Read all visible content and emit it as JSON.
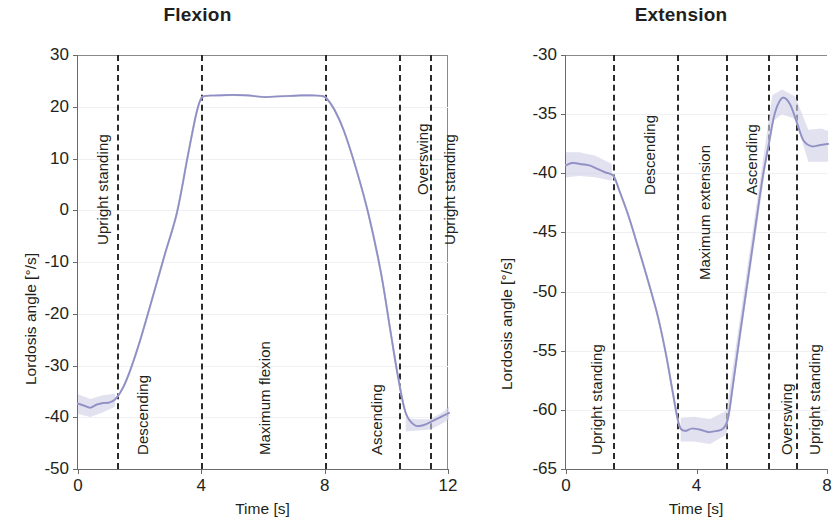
{
  "figure": {
    "panels": [
      {
        "key": "flexion",
        "title": "Flexion",
        "ylabel": "Lordosis angle [°/s]",
        "xlabel": "Time [s]",
        "yticks": [
          "30",
          "20",
          "10",
          "0",
          "-10",
          "-20",
          "-30",
          "-40",
          "-50"
        ],
        "xticks": [
          "0",
          "4",
          "8",
          "12"
        ],
        "phases": [
          "Upright standing",
          "Descending",
          "Maximum flexion",
          "Ascending",
          "Overswing",
          "Upright standing"
        ]
      },
      {
        "key": "extension",
        "title": "Extension",
        "ylabel": "Lordosis angle [°/s]",
        "xlabel": "Time [s]",
        "yticks": [
          "-30",
          "-35",
          "-40",
          "-45",
          "-50",
          "-55",
          "-60",
          "-65"
        ],
        "xticks": [
          "0",
          "4",
          "8"
        ],
        "phases": [
          "Upright standing",
          "Descending",
          "Maximum extension",
          "Ascending",
          "Overswing",
          "Upright standing"
        ]
      }
    ]
  },
  "chart_data": [
    {
      "type": "line",
      "title": "Flexion",
      "xlabel": "Time [s]",
      "ylabel": "Lordosis angle [°/s]",
      "xlim": [
        0,
        12
      ],
      "ylim": [
        -50,
        30
      ],
      "xticks": [
        0,
        4,
        8,
        12
      ],
      "yticks": [
        30,
        20,
        10,
        0,
        -10,
        -20,
        -30,
        -40,
        -50
      ],
      "grid": "horizontal-faint",
      "legend": "none",
      "phase_boundaries_s": [
        1.25,
        4.0,
        8.0,
        10.4,
        11.4
      ],
      "phase_labels": [
        {
          "label": "Upright standing",
          "start_s": 0.0,
          "end_s": 1.25
        },
        {
          "label": "Descending",
          "start_s": 1.25,
          "end_s": 4.0
        },
        {
          "label": "Maximum flexion",
          "start_s": 4.0,
          "end_s": 8.0
        },
        {
          "label": "Ascending",
          "start_s": 8.0,
          "end_s": 10.4
        },
        {
          "label": "Overswing",
          "start_s": 10.4,
          "end_s": 11.4
        },
        {
          "label": "Upright standing",
          "start_s": 11.4,
          "end_s": 12.0
        }
      ],
      "series": [
        {
          "name": "Mean lordosis angle",
          "x": [
            0.0,
            0.2,
            0.4,
            0.6,
            0.8,
            1.0,
            1.2,
            1.45,
            1.7,
            2.0,
            2.4,
            2.8,
            3.2,
            3.55,
            3.8,
            3.95,
            4.1,
            4.5,
            5.0,
            5.5,
            6.0,
            6.4,
            6.8,
            7.2,
            7.6,
            7.9,
            8.05,
            8.3,
            8.6,
            9.0,
            9.4,
            9.8,
            10.1,
            10.35,
            10.6,
            10.9,
            11.2,
            11.45,
            11.7,
            12.0
          ],
          "y": [
            -37.2,
            -37.6,
            -38.0,
            -37.4,
            -37.1,
            -37.0,
            -36.4,
            -34.2,
            -30.6,
            -25.2,
            -17.0,
            -8.6,
            -0.4,
            10.5,
            18.0,
            21.2,
            22.1,
            22.2,
            22.3,
            22.2,
            21.9,
            22.0,
            22.1,
            22.2,
            22.2,
            22.1,
            21.6,
            19.4,
            15.4,
            8.0,
            -0.8,
            -12.0,
            -23.0,
            -32.0,
            -39.0,
            -41.4,
            -41.3,
            -40.6,
            -39.9,
            -39.0
          ]
        },
        {
          "name": "Variability band (upper)",
          "x": [
            0.0,
            0.4,
            0.8,
            1.2,
            10.6,
            11.0,
            11.4,
            11.8,
            12.0
          ],
          "y": [
            -35.4,
            -36.3,
            -35.6,
            -35.3,
            -40.0,
            -40.2,
            -40.2,
            -38.8,
            -37.8
          ]
        },
        {
          "name": "Variability band (lower)",
          "x": [
            0.0,
            0.4,
            0.8,
            1.2,
            10.6,
            11.0,
            11.4,
            11.8,
            12.0
          ],
          "y": [
            -39.2,
            -39.8,
            -38.9,
            -37.8,
            -42.6,
            -42.4,
            -42.2,
            -41.0,
            -40.2
          ]
        }
      ]
    },
    {
      "type": "line",
      "title": "Extension",
      "xlabel": "Time [s]",
      "ylabel": "Lordosis angle [°/s]",
      "xlim": [
        0,
        8
      ],
      "ylim": [
        -65,
        -30
      ],
      "xticks": [
        0,
        4,
        8
      ],
      "yticks": [
        -30,
        -35,
        -40,
        -45,
        -50,
        -55,
        -60,
        -65
      ],
      "grid": "horizontal-faint",
      "legend": "none",
      "phase_boundaries_s": [
        1.45,
        3.4,
        4.9,
        6.2,
        7.05
      ],
      "phase_labels": [
        {
          "label": "Upright standing",
          "start_s": 0.0,
          "end_s": 1.45
        },
        {
          "label": "Descending",
          "start_s": 1.45,
          "end_s": 3.4
        },
        {
          "label": "Maximum extension",
          "start_s": 3.4,
          "end_s": 4.9
        },
        {
          "label": "Ascending",
          "start_s": 4.9,
          "end_s": 6.2
        },
        {
          "label": "Overswing",
          "start_s": 6.2,
          "end_s": 7.05
        },
        {
          "label": "Upright standing",
          "start_s": 7.05,
          "end_s": 8.0
        }
      ],
      "series": [
        {
          "name": "Mean lordosis angle",
          "x": [
            0.0,
            0.2,
            0.45,
            0.7,
            0.95,
            1.2,
            1.45,
            1.65,
            1.9,
            2.2,
            2.5,
            2.8,
            3.05,
            3.25,
            3.4,
            3.5,
            3.65,
            3.85,
            4.1,
            4.35,
            4.6,
            4.8,
            4.95,
            5.1,
            5.3,
            5.55,
            5.8,
            6.0,
            6.2,
            6.35,
            6.5,
            6.65,
            6.85,
            7.05,
            7.25,
            7.5,
            7.75,
            8.0
          ],
          "y": [
            -39.3,
            -39.1,
            -39.2,
            -39.3,
            -39.6,
            -39.9,
            -40.2,
            -41.6,
            -43.5,
            -46.2,
            -49.0,
            -52.0,
            -55.2,
            -58.3,
            -60.6,
            -61.5,
            -61.7,
            -61.5,
            -61.6,
            -61.8,
            -61.7,
            -61.5,
            -60.6,
            -57.8,
            -53.8,
            -49.0,
            -44.2,
            -40.4,
            -37.4,
            -35.2,
            -34.0,
            -33.6,
            -34.2,
            -35.7,
            -37.2,
            -37.7,
            -37.6,
            -37.5
          ]
        },
        {
          "name": "Variability band (upper)",
          "x": [
            0.0,
            0.4,
            0.9,
            1.4,
            3.5,
            3.9,
            4.4,
            4.9,
            6.3,
            6.6,
            7.0,
            7.4,
            7.8,
            8.0
          ],
          "y": [
            -38.2,
            -38.2,
            -38.5,
            -39.2,
            -60.6,
            -60.5,
            -60.7,
            -60.0,
            -33.4,
            -32.9,
            -33.5,
            -36.3,
            -36.2,
            -36.4
          ]
        },
        {
          "name": "Variability band (lower)",
          "x": [
            0.0,
            0.4,
            0.9,
            1.4,
            3.5,
            3.9,
            4.4,
            4.9,
            6.3,
            6.6,
            7.0,
            7.4,
            7.8,
            8.0
          ],
          "y": [
            -40.3,
            -40.2,
            -40.3,
            -40.6,
            -62.6,
            -62.6,
            -62.8,
            -62.0,
            -35.6,
            -35.0,
            -35.4,
            -39.0,
            -39.0,
            -39.0
          ]
        }
      ]
    }
  ]
}
